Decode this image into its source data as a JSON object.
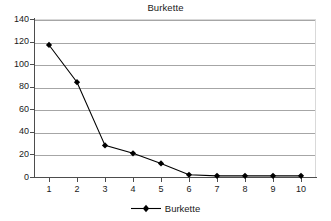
{
  "chart_data": {
    "type": "line",
    "title": "Burkette",
    "xlabel": "",
    "ylabel": "",
    "x": [
      1,
      2,
      3,
      4,
      5,
      6,
      7,
      8,
      9,
      10
    ],
    "categories": [
      "1",
      "2",
      "3",
      "4",
      "5",
      "6",
      "7",
      "8",
      "9",
      "10"
    ],
    "series": [
      {
        "name": "Burkette",
        "values": [
          117,
          84,
          28,
          21,
          12,
          2,
          1,
          1,
          1,
          1
        ],
        "color": "#000000",
        "marker": "diamond"
      }
    ],
    "ylim": [
      0,
      140
    ],
    "ytick_values": [
      0,
      20,
      40,
      60,
      80,
      100,
      120,
      140
    ],
    "ytick_labels": [
      "0",
      "20",
      "40",
      "60",
      "80",
      "100",
      "120",
      "140"
    ],
    "xlim": [
      0.5,
      10.5
    ],
    "grid": "horizontal",
    "grid_color": "#a6a6a6",
    "legend_position": "bottom",
    "legend_entries": [
      "Burkette"
    ],
    "plot_background": "#ffffff",
    "axis_color": "#4d4d4d"
  }
}
